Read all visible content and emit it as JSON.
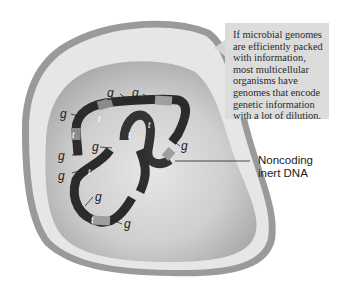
{
  "callout": {
    "lines": [
      "If microbial genomes",
      "are efficiently packed",
      "with information,",
      "most multicellular",
      "organisms have",
      "genomes that encode",
      "genetic information",
      "with a lot of dilution."
    ]
  },
  "annotation": {
    "line1": "Noncoding",
    "line2": "inert DNA"
  },
  "labels": {
    "gene": "g",
    "transposon": "t"
  },
  "colors": {
    "cell_wall": "#9a9a9a",
    "cell_membrane_gap": "#e4e4e4",
    "cytoplasm": "#bdbdbd",
    "dna_dark": "#2b2b2b",
    "dna_gene": "#9e9e9e",
    "callout_bg": "#dcdcdc"
  }
}
